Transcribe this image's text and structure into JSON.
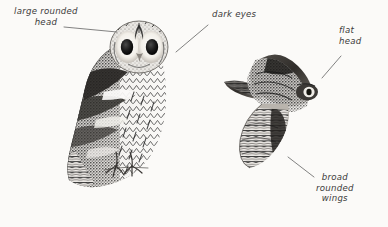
{
  "figure": {
    "background_color": "#fbfaf8",
    "ink_color": "#2f2f2f",
    "leader_color": "#6b6b6b",
    "text_color": "#3b3b3b"
  },
  "illustrations": [
    {
      "name": "perched-owl",
      "pose": "perched, front view",
      "description": "Tawny owl perched facing viewer with large rounded head, pale facial disc, dark eyes, mottled and barred breast, talons visible on a branch"
    },
    {
      "name": "flying-owl",
      "pose": "in flight, from below/above",
      "description": "Owl in flight showing flat head, broad rounded wings and barred underwing"
    }
  ],
  "annotations": [
    {
      "id": "large-rounded-head",
      "lines": [
        "large rounded",
        "head"
      ],
      "align": "center",
      "text_x": 14,
      "text_y": 6,
      "leader": {
        "x1": 64,
        "y1": 27,
        "x2": 117,
        "y2": 32
      }
    },
    {
      "id": "dark-eyes",
      "lines": [
        "dark eyes"
      ],
      "align": "left",
      "text_x": 212,
      "text_y": 9,
      "leader": {
        "x1": 208,
        "y1": 25,
        "x2": 176,
        "y2": 52
      }
    },
    {
      "id": "flat-head",
      "lines": [
        "flat",
        "head"
      ],
      "align": "left",
      "text_x": 339,
      "text_y": 25,
      "leader": {
        "x1": 341,
        "y1": 56,
        "x2": 322,
        "y2": 78
      }
    },
    {
      "id": "broad-rounded-wings",
      "lines": [
        "broad",
        "rounded",
        "wings"
      ],
      "align": "center",
      "text_x": 316,
      "text_y": 172,
      "leader": {
        "x1": 288,
        "y1": 157,
        "x2": 314,
        "y2": 177
      }
    }
  ]
}
